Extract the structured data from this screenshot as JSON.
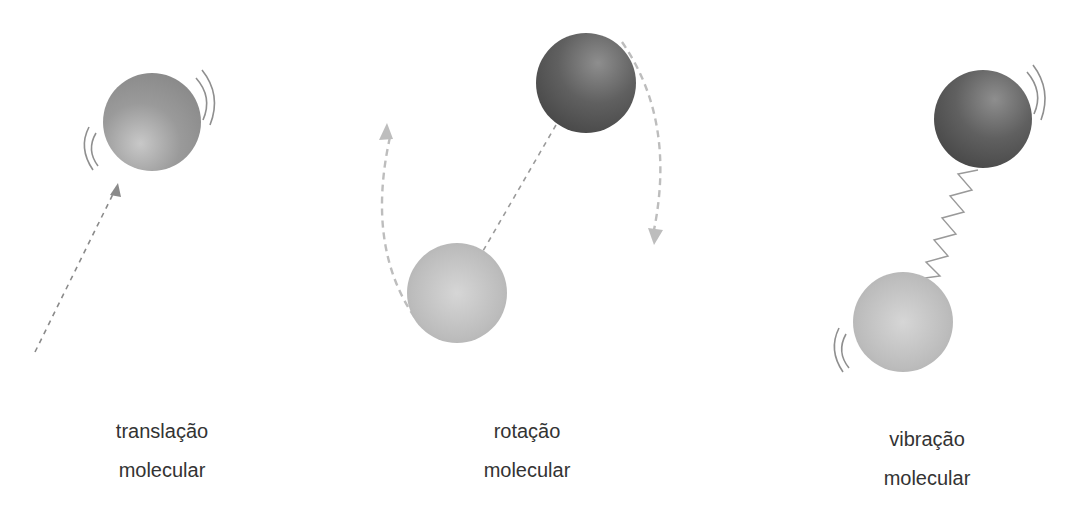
{
  "figure": {
    "panels": [
      {
        "id": "translation",
        "label_line1": "translação",
        "label_line2": "molecular",
        "label_center_x": 162
      },
      {
        "id": "rotation",
        "label_line1": "rotação",
        "label_line2": "molecular",
        "label_center_x": 527
      },
      {
        "id": "vibration",
        "label_line1": "vibração",
        "label_line2": "molecular",
        "label_center_x": 927
      }
    ],
    "icons": {
      "sphere_light": "light-sphere",
      "sphere_dark": "dark-sphere",
      "arrow": "dashed-arrow",
      "spring": "zigzag-spring",
      "motion_lines": "motion-lines"
    },
    "colors": {
      "sphere_light": "#bdbdbd",
      "sphere_mid": "#8c8c8c",
      "sphere_dark": "#505050",
      "arrow_dashed": "#b8b8b8",
      "translation_arrow": "#8a8a8a",
      "spring": "#9a9a9a",
      "text": "#333333"
    }
  }
}
